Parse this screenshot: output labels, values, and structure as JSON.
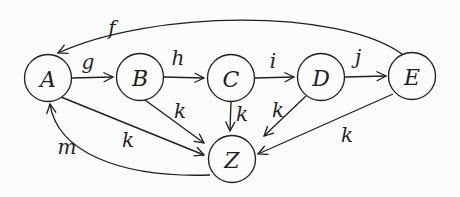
{
  "figure": {
    "background": "#fcfcfc",
    "stroke_color": "#1f1f1f",
    "node_fill": "#fcfcfc",
    "node_radius": 23.5,
    "nodes": [
      {
        "id": "A",
        "label": "A",
        "x": 48,
        "y": 78
      },
      {
        "id": "B",
        "label": "B",
        "x": 140,
        "y": 77
      },
      {
        "id": "C",
        "label": "C",
        "x": 231,
        "y": 78
      },
      {
        "id": "D",
        "label": "D",
        "x": 321,
        "y": 77
      },
      {
        "id": "E",
        "label": "E",
        "x": 412,
        "y": 76
      },
      {
        "id": "Z",
        "label": "Z",
        "x": 232,
        "y": 159
      }
    ],
    "edges": [
      {
        "from": "E",
        "to": "A",
        "label": "f",
        "path": "M 402 54 C 338 8, 152 10, 58 53",
        "label_x": 112,
        "label_y": 28
      },
      {
        "from": "A",
        "to": "B",
        "label": "g",
        "x1": 71,
        "y1": 78,
        "x2": 113,
        "y2": 77,
        "label_x": 88,
        "label_y": 62
      },
      {
        "from": "B",
        "to": "C",
        "label": "h",
        "x1": 164,
        "y1": 77,
        "x2": 204,
        "y2": 78,
        "label_x": 178,
        "label_y": 58
      },
      {
        "from": "C",
        "to": "D",
        "label": "i",
        "x1": 255,
        "y1": 78,
        "x2": 294,
        "y2": 77,
        "label_x": 273,
        "label_y": 61
      },
      {
        "from": "D",
        "to": "E",
        "label": "j",
        "x1": 345,
        "y1": 77,
        "x2": 386,
        "y2": 76,
        "label_x": 358,
        "label_y": 57
      },
      {
        "from": "A",
        "to": "Z",
        "label": "k",
        "x1": 61,
        "y1": 97,
        "x2": 204,
        "y2": 155,
        "label_x": 128,
        "label_y": 140
      },
      {
        "from": "B",
        "to": "Z",
        "label": "k",
        "x1": 145,
        "y1": 100,
        "x2": 204,
        "y2": 143,
        "label_x": 180,
        "label_y": 111
      },
      {
        "from": "C",
        "to": "Z",
        "label": "k",
        "x1": 231,
        "y1": 101,
        "x2": 230,
        "y2": 131,
        "label_x": 242,
        "label_y": 114
      },
      {
        "from": "D",
        "to": "Z",
        "label": "k",
        "x1": 306,
        "y1": 96,
        "x2": 264,
        "y2": 136,
        "label_x": 278,
        "label_y": 110
      },
      {
        "from": "E",
        "to": "Z",
        "label": "k",
        "x1": 393,
        "y1": 94,
        "x2": 258,
        "y2": 154,
        "label_x": 347,
        "label_y": 135
      },
      {
        "from": "Z",
        "to": "A",
        "label": "m",
        "path": "M 210 175 C 118 178, 57 151, 50 104",
        "label_x": 67,
        "label_y": 147
      }
    ]
  }
}
